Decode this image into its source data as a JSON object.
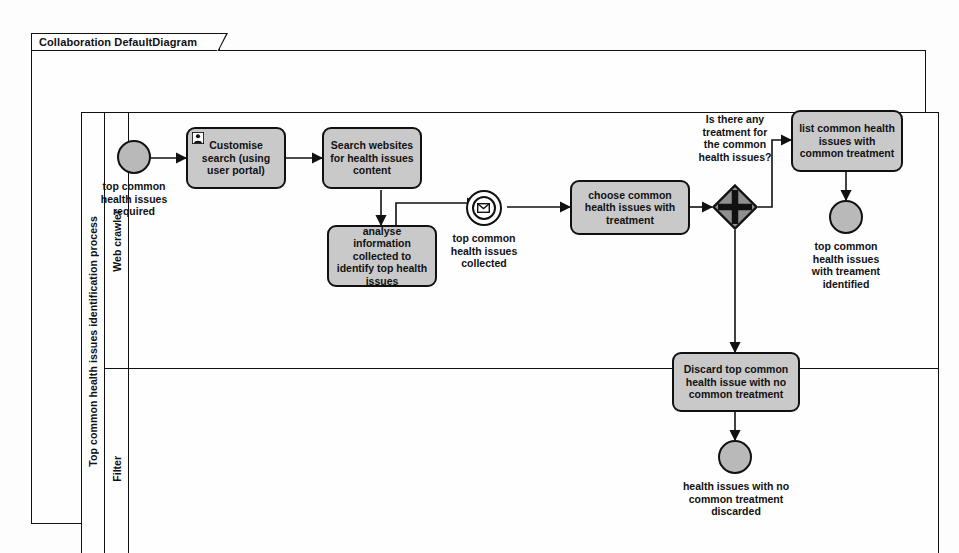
{
  "frame": {
    "tab_label": "Collaboration DefaultDiagram"
  },
  "pool": {
    "label": "Top common health issues identification process",
    "lanes": [
      {
        "id": "web-crawler",
        "label": "Web crawler"
      },
      {
        "id": "filter",
        "label": "Filter"
      }
    ]
  },
  "colors": {
    "task_fill": "#c9c9c9",
    "event_fill": "#b9b9b9",
    "gateway_fill": "#8f8f8f",
    "stroke": "#111111",
    "canvas": "#fdfdfd"
  },
  "events": {
    "start_required": {
      "type": "start-event",
      "label": "top common\nhealth issues\nrequired"
    },
    "intermediate_collected": {
      "type": "intermediate-message-event",
      "icon": "envelope-icon",
      "label": "top common\nhealth issues\ncollected"
    },
    "end_identified": {
      "type": "end-event",
      "label": "top common\nhealth issues\nwith treament\nidentified"
    },
    "end_discarded": {
      "type": "end-event",
      "label": "health issues with no\ncommon treatment\ndiscarded"
    }
  },
  "tasks": {
    "customise_search": {
      "label": "Customise search\n(using user portal)",
      "icon": "user-task-icon",
      "lane": "web-crawler"
    },
    "search_websites": {
      "label": "Search websites\nfor health issues\ncontent",
      "lane": "web-crawler"
    },
    "analyse_information": {
      "label": "analyse information\ncollected  to identify\ntop health issues",
      "lane": "web-crawler"
    },
    "choose_common": {
      "label": "choose common\nhealth issues with\ntreatment",
      "lane": "web-crawler"
    },
    "list_common": {
      "label": "list common health\nissues with\ncommon treatment",
      "lane": "web-crawler"
    },
    "discard_top": {
      "label": "Discard top common\nhealth issue  with no\ncommon treatment",
      "lane": "filter"
    }
  },
  "gateway": {
    "type": "complex-gateway",
    "label": "Is there any\ntreatment for\nthe common\nhealth issues?"
  }
}
